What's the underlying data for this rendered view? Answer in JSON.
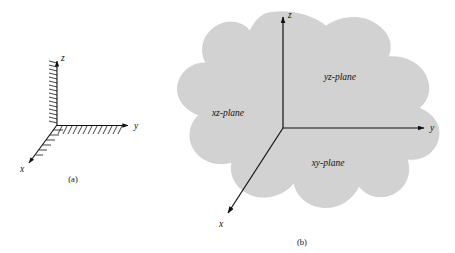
{
  "figure": {
    "background_color": "#ffffff",
    "line_color": "#111111",
    "blob_fill_color": "#d2d2d2",
    "blob_stroke_color": "#b4b4b4",
    "panels": [
      {
        "id": "panel-a",
        "caption": "(a)",
        "axes": [
          {
            "name": "z",
            "label": "z",
            "direction": "up"
          },
          {
            "name": "y",
            "label": "y",
            "direction": "right"
          },
          {
            "name": "x",
            "label": "x",
            "direction": "down-left"
          }
        ],
        "hatching": true,
        "hatch_counts": {
          "z_axis": 17,
          "y_axis": 15,
          "x_axis": 7
        }
      },
      {
        "id": "panel-b",
        "caption": "(b)",
        "axes": [
          {
            "name": "z",
            "label": "z",
            "direction": "up"
          },
          {
            "name": "y",
            "label": "y",
            "direction": "right"
          },
          {
            "name": "x",
            "label": "x",
            "direction": "down-left"
          }
        ],
        "regions": [
          {
            "name": "yz-plane",
            "label": "yz-plane"
          },
          {
            "name": "xz-plane",
            "label": "xz-plane"
          },
          {
            "name": "xy-plane",
            "label": "xy-plane"
          }
        ]
      }
    ]
  }
}
